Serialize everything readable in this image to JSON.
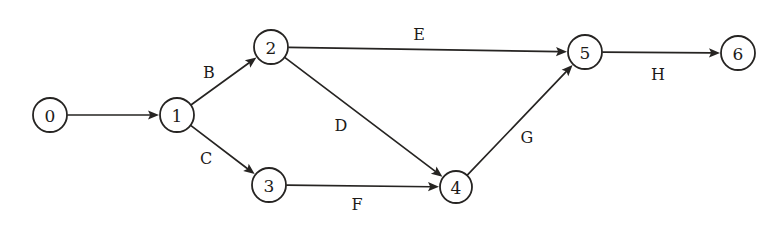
{
  "diagram": {
    "type": "directed-graph",
    "background_color": "#ffffff",
    "stroke_color": "#262422",
    "text_color": "#1d1b19",
    "node_fill": "#ffffff",
    "node_radius": 17,
    "nodes": [
      {
        "id": "0",
        "label": "0",
        "cx": 50,
        "cy": 115,
        "r": 17
      },
      {
        "id": "1",
        "label": "1",
        "cx": 177,
        "cy": 115,
        "r": 17
      },
      {
        "id": "2",
        "label": "2",
        "cx": 271,
        "cy": 47,
        "r": 17
      },
      {
        "id": "3",
        "label": "3",
        "cx": 269,
        "cy": 185,
        "r": 17
      },
      {
        "id": "4",
        "label": "4",
        "cx": 456,
        "cy": 187,
        "r": 16
      },
      {
        "id": "5",
        "label": "5",
        "cx": 585,
        "cy": 52,
        "r": 17
      },
      {
        "id": "6",
        "label": "6",
        "cx": 738,
        "cy": 53,
        "r": 17
      }
    ],
    "edges": [
      {
        "id": "e0",
        "from": "0",
        "to": "1",
        "label": "",
        "label_x": 113,
        "label_y": 100
      },
      {
        "id": "eB",
        "from": "1",
        "to": "2",
        "label": "B",
        "label_x": 209,
        "label_y": 72
      },
      {
        "id": "eC",
        "from": "1",
        "to": "3",
        "label": "C",
        "label_x": 206,
        "label_y": 158
      },
      {
        "id": "eE",
        "from": "2",
        "to": "5",
        "label": "E",
        "label_x": 419,
        "label_y": 34
      },
      {
        "id": "eD",
        "from": "2",
        "to": "4",
        "label": "D",
        "label_x": 341,
        "label_y": 125
      },
      {
        "id": "eF",
        "from": "3",
        "to": "4",
        "label": "F",
        "label_x": 357,
        "label_y": 204
      },
      {
        "id": "eG",
        "from": "4",
        "to": "5",
        "label": "G",
        "label_x": 527,
        "label_y": 137
      },
      {
        "id": "eH",
        "from": "5",
        "to": "6",
        "label": "H",
        "label_x": 658,
        "label_y": 74
      }
    ]
  }
}
